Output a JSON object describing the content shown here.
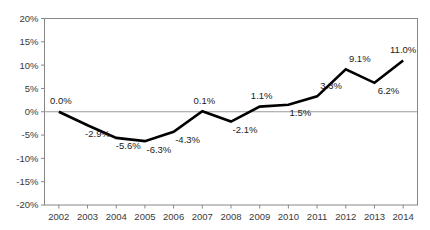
{
  "chart_data": {
    "type": "line",
    "title": "",
    "xlabel": "",
    "ylabel": "",
    "categories": [
      "2002",
      "2003",
      "2004",
      "2005",
      "2006",
      "2007",
      "2008",
      "2009",
      "2010",
      "2011",
      "2012",
      "2013",
      "2014"
    ],
    "values": [
      0.0,
      -2.9,
      -5.6,
      -6.3,
      -4.3,
      0.1,
      -2.1,
      1.1,
      1.5,
      3.3,
      9.1,
      6.2,
      11.0
    ],
    "point_labels": [
      "0.0%",
      "-2.9%",
      "-5.6%",
      "-6.3%",
      "-4.3%",
      "0.1%",
      "-2.1%",
      "1.1%",
      "1.5%",
      "3.3%",
      "9.1%",
      "6.2%",
      "11.0%"
    ],
    "ylim": [
      -20,
      20
    ],
    "ytick_values": [
      20,
      15,
      10,
      5,
      0,
      -5,
      -10,
      -15,
      -20
    ],
    "ytick_labels": [
      "20%",
      "15%",
      "10%",
      "5%",
      "0%",
      "-5%",
      "-10%",
      "-15%",
      "-20%"
    ],
    "grid": false,
    "zero_line": true,
    "legend": "none",
    "series_color": "#000000",
    "axis_color": "#878787",
    "background_color": "#ffffff"
  }
}
